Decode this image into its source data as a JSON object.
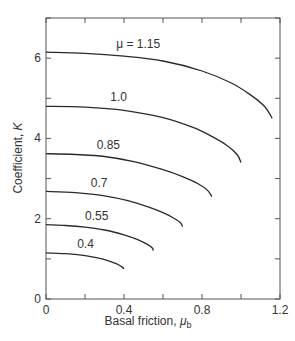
{
  "chart_data": {
    "type": "line",
    "title": "",
    "xlabel": "Basal friction, μ_b",
    "xlabel_main": "Basal friction, ",
    "xlabel_symbol": "μ",
    "xlabel_sub": "b",
    "ylabel": "Coefficient, K",
    "ylabel_main": "Coefficient, ",
    "ylabel_symbol": "K",
    "xlim": [
      0,
      1.2
    ],
    "ylim": [
      0,
      7
    ],
    "x_ticks": [
      0,
      0.2,
      0.4,
      0.6,
      0.8,
      1.0,
      1.2
    ],
    "x_tick_labels": [
      {
        "value": 0,
        "label": "0"
      },
      {
        "value": 0.4,
        "label": "0.4"
      },
      {
        "value": 0.8,
        "label": "0.8"
      },
      {
        "value": 1.2,
        "label": "1.2"
      }
    ],
    "y_ticks": [
      0,
      1,
      2,
      3,
      4,
      5,
      6,
      7
    ],
    "y_tick_labels": [
      {
        "value": 0,
        "label": "0"
      },
      {
        "value": 2,
        "label": "2"
      },
      {
        "value": 4,
        "label": "4"
      },
      {
        "value": 6,
        "label": "6"
      }
    ],
    "grid": false,
    "legend": "inline curve labels",
    "series": [
      {
        "name": "μ = 1.15",
        "label": "μ = 1.15",
        "label_pos": [
          0.36,
          6.25
        ],
        "x": [
          0,
          0.2,
          0.4,
          0.6,
          0.8,
          0.95,
          1.05,
          1.12,
          1.16
        ],
        "y": [
          6.15,
          6.12,
          6.05,
          5.93,
          5.68,
          5.38,
          5.08,
          4.8,
          4.5
        ]
      },
      {
        "name": "1.0",
        "label": "1.0",
        "label_pos": [
          0.33,
          4.92
        ],
        "x": [
          0,
          0.2,
          0.4,
          0.6,
          0.75,
          0.85,
          0.93,
          0.98,
          1.0
        ],
        "y": [
          4.8,
          4.78,
          4.7,
          4.52,
          4.28,
          4.05,
          3.82,
          3.6,
          3.4
        ]
      },
      {
        "name": "0.85",
        "label": "0.85",
        "label_pos": [
          0.26,
          3.74
        ],
        "x": [
          0,
          0.15,
          0.3,
          0.45,
          0.6,
          0.7,
          0.78,
          0.83,
          0.85
        ],
        "y": [
          3.62,
          3.6,
          3.55,
          3.42,
          3.22,
          3.05,
          2.87,
          2.7,
          2.55
        ]
      },
      {
        "name": "0.7",
        "label": "0.7",
        "label_pos": [
          0.23,
          2.8
        ],
        "x": [
          0,
          0.15,
          0.3,
          0.42,
          0.52,
          0.6,
          0.66,
          0.69,
          0.7
        ],
        "y": [
          2.68,
          2.65,
          2.57,
          2.45,
          2.3,
          2.15,
          2.0,
          1.9,
          1.8
        ]
      },
      {
        "name": "0.55",
        "label": "0.55",
        "label_pos": [
          0.2,
          1.97
        ],
        "x": [
          0,
          0.1,
          0.2,
          0.3,
          0.4,
          0.47,
          0.52,
          0.545,
          0.55
        ],
        "y": [
          1.85,
          1.83,
          1.79,
          1.72,
          1.6,
          1.48,
          1.36,
          1.27,
          1.2
        ]
      },
      {
        "name": "0.4",
        "label": "0.4",
        "label_pos": [
          0.16,
          1.27
        ],
        "x": [
          0,
          0.1,
          0.2,
          0.27,
          0.32,
          0.36,
          0.39,
          0.4
        ],
        "y": [
          1.15,
          1.13,
          1.08,
          1.02,
          0.95,
          0.88,
          0.8,
          0.75
        ]
      }
    ],
    "colors": {
      "curve": "#2a2a2a",
      "axis": "#555555",
      "text": "#333333"
    }
  }
}
